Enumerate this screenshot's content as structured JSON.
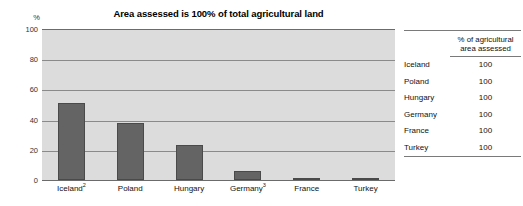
{
  "chart_data": {
    "type": "bar",
    "title": "Area assessed is 100% of total agricultural land",
    "xlabel": "",
    "ylabel": "%",
    "ylim": [
      0,
      100
    ],
    "yticks": [
      0,
      20,
      40,
      60,
      80,
      100
    ],
    "grid": true,
    "legend": "none",
    "categories": [
      "Iceland²",
      "Poland",
      "Hungary",
      "Germany³",
      "France",
      "Turkey"
    ],
    "categories_plain": [
      "Iceland",
      "Poland",
      "Hungary",
      "Germany",
      "France",
      "Turkey"
    ],
    "category_footnotes": [
      "2",
      "",
      "",
      "3",
      "",
      ""
    ],
    "values": [
      51,
      38,
      23,
      6,
      1.5,
      0.5
    ],
    "bar_color": "#646464",
    "plot_background": "#dcdcdc",
    "axis_color": "#6b6b6b"
  },
  "chart": {
    "title": "Area assessed is 100% of total agricultural land",
    "y_axis_unit": "%",
    "y_tick_labels": [
      "100",
      "80",
      "60",
      "40",
      "20",
      "0"
    ],
    "x_tick_labels": [
      {
        "name": "Iceland",
        "note": "2"
      },
      {
        "name": "Poland",
        "note": ""
      },
      {
        "name": "Hungary",
        "note": ""
      },
      {
        "name": "Germany",
        "note": "3"
      },
      {
        "name": "France",
        "note": ""
      },
      {
        "name": "Turkey",
        "note": ""
      }
    ]
  },
  "table": {
    "header": {
      "label_column": "",
      "value_column_line1": "% of agricultural",
      "value_column_line2": "area assessed"
    },
    "rows": [
      {
        "label": "Iceland",
        "value": "100"
      },
      {
        "label": "Poland",
        "value": "100"
      },
      {
        "label": "Hungary",
        "value": "100"
      },
      {
        "label": "Germany",
        "value": "100"
      },
      {
        "label": "France",
        "value": "100"
      },
      {
        "label": "Turkey",
        "value": "100"
      }
    ]
  }
}
